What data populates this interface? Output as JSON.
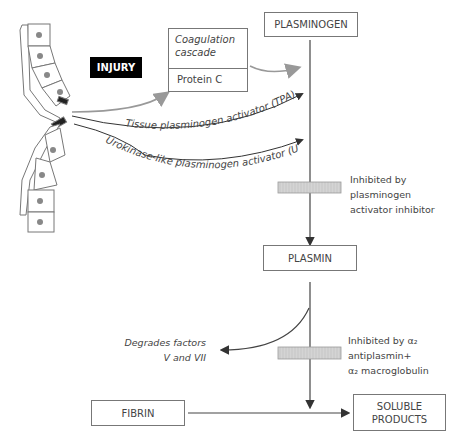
{
  "diagram": {
    "nodes": {
      "injury": "INJURY",
      "coagulation_cascade": "Coagulation cascade",
      "protein_c": "Protein C",
      "plasminogen": "PLASMINOGEN",
      "plasmin": "PLASMIN",
      "fibrin": "FIBRIN",
      "soluble_products_line1": "SOLUBLE",
      "soluble_products_line2": "PRODUCTS"
    },
    "edges": {
      "tpa": "Tissue plasminogen activator (TPA)",
      "upa": "Urokinase-like plasminogen activator (UPA)"
    },
    "annotations": {
      "pai_line1": "Inhibited by",
      "pai_line2": "plasminogen",
      "pai_line3": "activator inhibitor",
      "a2_line1": "Inhibited by α₂",
      "a2_line2": "antiplasmin+",
      "a2_line3": "α₂ macroglobulin",
      "degrades_line1": "Degrades factors",
      "degrades_line2": "V and VII"
    },
    "colors": {
      "line": "#444444",
      "gray_arrow": "#999999",
      "inhibitor_bar": "#d0d0d0",
      "injury_bg": "#000000"
    }
  }
}
